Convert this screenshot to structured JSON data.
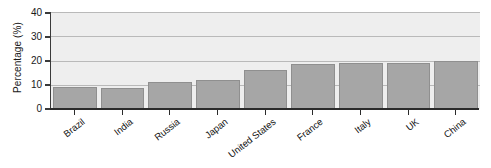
{
  "chart_data": {
    "type": "bar",
    "title": "",
    "xlabel": "",
    "ylabel": "Percentage (%)",
    "categories": [
      "Brazil",
      "India",
      "Russia",
      "Japan",
      "United States",
      "France",
      "Italy",
      "UK",
      "China"
    ],
    "values": [
      9,
      8.5,
      11,
      12,
      16,
      18.5,
      19,
      19,
      20
    ],
    "ylim": [
      0,
      40
    ],
    "yticks": [
      0,
      10,
      20,
      30,
      40
    ],
    "ytick_labels": [
      "0",
      "10",
      "20",
      "30",
      "40"
    ],
    "grid": true,
    "legend": "none",
    "bar_color": "#a6a6a6",
    "bar_edge_color": "#8f8f8f",
    "plot_background": "#eeeeee",
    "axis_color": "#2b2b2b",
    "gridline_color": "#b9b9b9"
  }
}
